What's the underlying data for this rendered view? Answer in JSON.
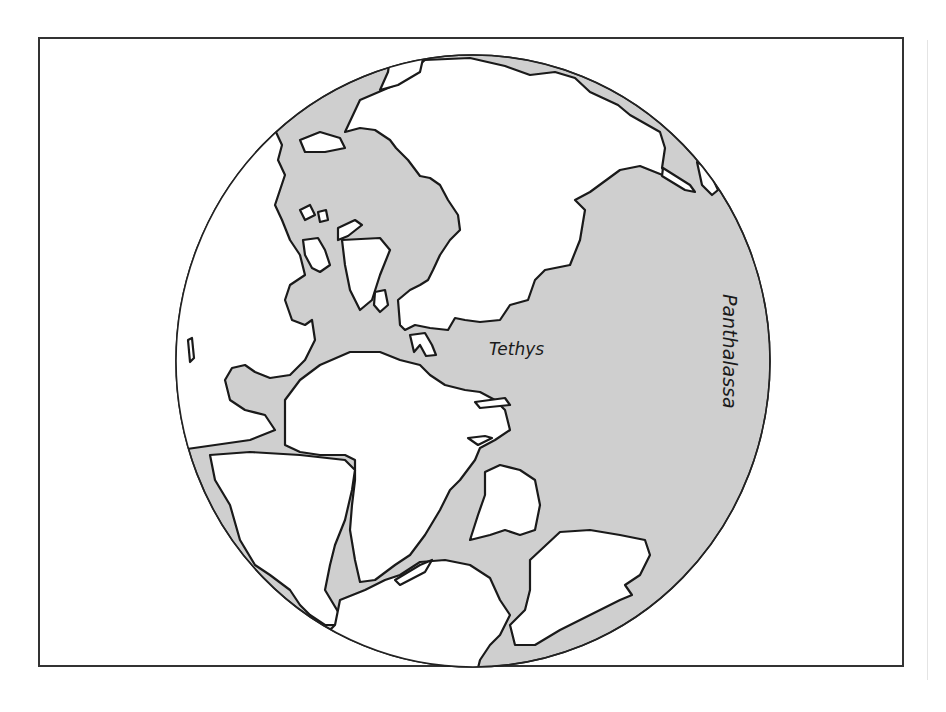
{
  "figure": {
    "title": ""
  },
  "map": {
    "projection": "orthographic",
    "colors": {
      "ocean": "#cfcfcf",
      "land": "#ffffff",
      "outline": "#1a1a1a",
      "frame": "#333333"
    },
    "labels": {
      "tethys": "Tethys",
      "panthalassa": "Panthalassa"
    }
  }
}
